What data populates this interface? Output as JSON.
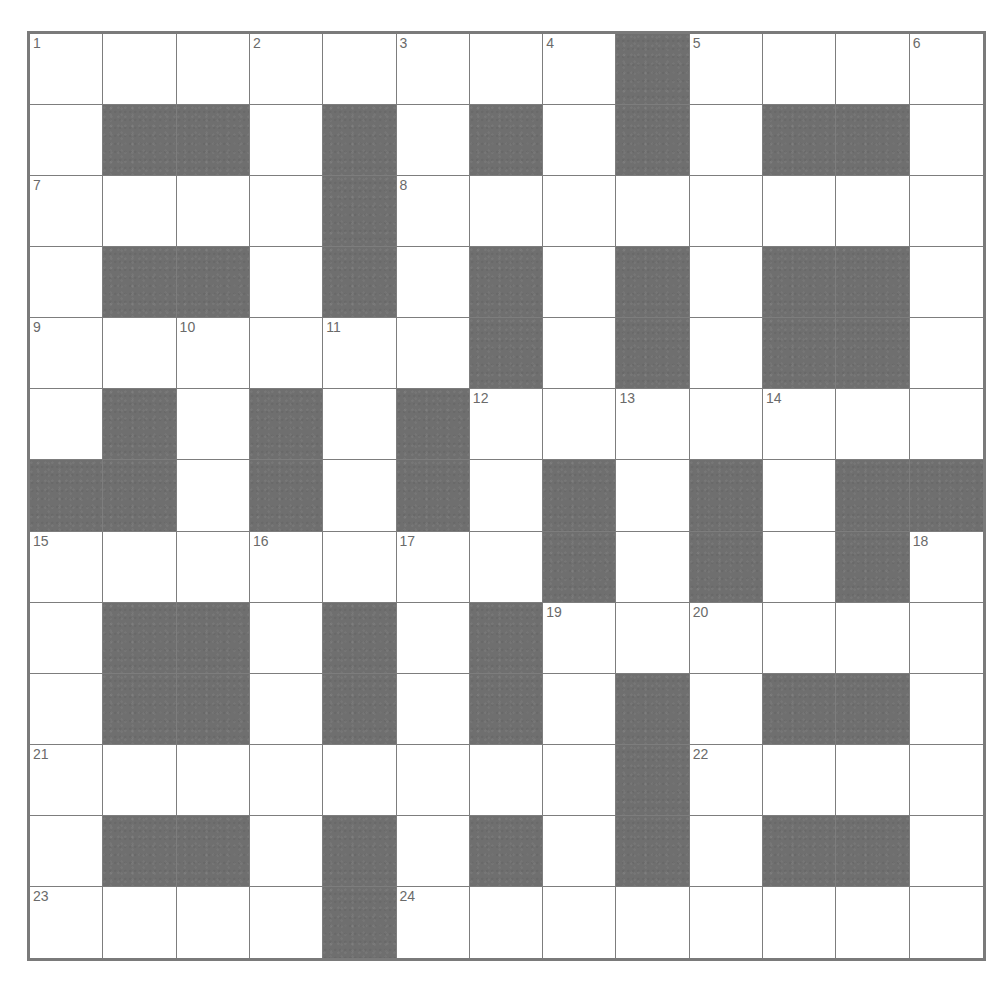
{
  "puzzle": {
    "rows": 13,
    "cols": 13,
    "colors": {
      "black_cell": "#6f6f6f",
      "white_cell": "#ffffff",
      "grid_line": "#7d7d7d",
      "border": "#7a7a7a",
      "number_text": "#6a6a6a"
    },
    "layout": [
      "........#....",
      ".##.#.#.#.##.",
      "....#........",
      ".##.#.#.#.##.",
      "......#.#.##.",
      ".#.#.#.......",
      "##.#.#.#.#.##",
      ".......#.#.#.",
      ".##.#.#......",
      ".##.#.#.#.##.",
      "........#....",
      ".##.#.#.#.##.",
      "....#........"
    ],
    "numbers": [
      {
        "n": "1",
        "r": 0,
        "c": 0
      },
      {
        "n": "2",
        "r": 0,
        "c": 3
      },
      {
        "n": "3",
        "r": 0,
        "c": 5
      },
      {
        "n": "4",
        "r": 0,
        "c": 7
      },
      {
        "n": "5",
        "r": 0,
        "c": 9
      },
      {
        "n": "6",
        "r": 0,
        "c": 12
      },
      {
        "n": "7",
        "r": 2,
        "c": 0
      },
      {
        "n": "8",
        "r": 2,
        "c": 5
      },
      {
        "n": "9",
        "r": 4,
        "c": 0
      },
      {
        "n": "10",
        "r": 4,
        "c": 2
      },
      {
        "n": "11",
        "r": 4,
        "c": 4
      },
      {
        "n": "12",
        "r": 5,
        "c": 6
      },
      {
        "n": "13",
        "r": 5,
        "c": 8
      },
      {
        "n": "14",
        "r": 5,
        "c": 10
      },
      {
        "n": "15",
        "r": 7,
        "c": 0
      },
      {
        "n": "16",
        "r": 7,
        "c": 3
      },
      {
        "n": "17",
        "r": 7,
        "c": 5
      },
      {
        "n": "18",
        "r": 7,
        "c": 12
      },
      {
        "n": "19",
        "r": 8,
        "c": 7
      },
      {
        "n": "20",
        "r": 8,
        "c": 9
      },
      {
        "n": "21",
        "r": 10,
        "c": 0
      },
      {
        "n": "22",
        "r": 10,
        "c": 9
      },
      {
        "n": "23",
        "r": 12,
        "c": 0
      },
      {
        "n": "24",
        "r": 12,
        "c": 5
      }
    ],
    "entries": {
      "letters_filled": []
    }
  }
}
